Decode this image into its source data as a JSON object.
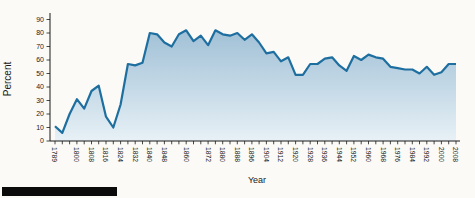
{
  "page": {
    "background": "#fbfaf7"
  },
  "figure_bar": {
    "color": "#0b0b0b"
  },
  "chart_data": {
    "type": "area",
    "title": "",
    "xlabel": "Year",
    "ylabel": "Percent",
    "ylim": [
      0,
      90
    ],
    "yticks": [
      0,
      10,
      20,
      30,
      40,
      50,
      60,
      70,
      80,
      90
    ],
    "grid": false,
    "legend": "none",
    "line_color": "#1e6fa0",
    "fill_top": "#9abcd3",
    "fill_mid": "#c3d8e6",
    "fill_bottom": "#e8f1f6",
    "axis_color": "#1a1a1a",
    "x": [
      1789,
      1792,
      1796,
      1800,
      1804,
      1808,
      1812,
      1816,
      1820,
      1824,
      1828,
      1832,
      1836,
      1840,
      1844,
      1848,
      1852,
      1856,
      1860,
      1864,
      1868,
      1872,
      1876,
      1880,
      1884,
      1888,
      1892,
      1896,
      1900,
      1904,
      1908,
      1912,
      1916,
      1920,
      1924,
      1928,
      1932,
      1936,
      1940,
      1944,
      1948,
      1952,
      1956,
      1960,
      1964,
      1968,
      1972,
      1976,
      1980,
      1984,
      1988,
      1992,
      1996,
      2000,
      2004,
      2008
    ],
    "values": [
      11,
      6,
      20,
      31,
      24,
      37,
      41,
      18,
      10,
      27,
      57,
      56,
      58,
      80,
      79,
      73,
      70,
      79,
      82,
      74,
      78,
      71,
      82,
      79,
      78,
      80,
      75,
      79,
      73,
      65,
      66,
      59,
      62,
      49,
      49,
      57,
      57,
      61,
      62,
      56,
      52,
      63,
      60,
      64,
      62,
      61,
      55,
      54,
      53,
      53,
      50,
      55,
      49,
      51,
      57,
      57
    ],
    "xtick_labels": [
      "1789",
      "1800",
      "1808",
      "1816",
      "1824",
      "1832",
      "1840",
      "1848",
      "1860",
      "1872",
      "1880",
      "1888",
      "1896",
      "1904",
      "1912",
      "1920",
      "1928",
      "1936",
      "1944",
      "1952",
      "1960",
      "1968",
      "1976",
      "1984",
      "1992",
      "2000",
      "2008"
    ]
  }
}
